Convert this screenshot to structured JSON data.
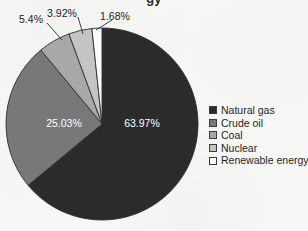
{
  "title": {
    "text": "gy",
    "note": "cropped-title-fragment"
  },
  "background_color": "#f7f7f5",
  "chart_data": {
    "type": "pie",
    "title": "",
    "categories": [
      "Natural gas",
      "Crude oil",
      "Coal",
      "Nuclear",
      "Renewable energy"
    ],
    "values": [
      63.97,
      25.03,
      5.4,
      3.92,
      1.68
    ],
    "value_labels": [
      "63.97%",
      "25.03%",
      "5.4%",
      "3.92%",
      "1.68%"
    ],
    "colors": [
      "#2b2b2b",
      "#787878",
      "#a8a8a8",
      "#c4c4c4",
      "#fbfbfa"
    ],
    "label_colors": [
      "#ffffff",
      "#ffffff",
      "#242424",
      "#242424",
      "#242424"
    ],
    "label_placement": [
      "inside",
      "inside",
      "outside",
      "outside",
      "outside"
    ],
    "start_angle_deg": 0,
    "direction": "clockwise",
    "legend_position": "right",
    "grid": false,
    "units": "percent"
  },
  "slices": [
    {
      "name": "Natural gas",
      "percent": 63.97,
      "label": "63.97%",
      "color": "#2b2b2b",
      "label_color": "#ffffff",
      "label_x": 142,
      "label_y": 124
    },
    {
      "name": "Crude oil",
      "percent": 25.03,
      "label": "25.03%",
      "color": "#787878",
      "label_color": "#ffffff",
      "label_x": 64,
      "label_y": 124
    },
    {
      "name": "Coal",
      "percent": 5.4,
      "label": "5.4%",
      "color": "#a8a8a8",
      "label_color": "#242424",
      "label_x": 31,
      "label_y": 20,
      "leader": {
        "x1": 47,
        "y1": 23,
        "x2": 62,
        "y2": 40
      }
    },
    {
      "name": "Nuclear",
      "percent": 3.92,
      "label": "3.92%",
      "color": "#c4c4c4",
      "label_color": "#242424",
      "label_x": 62,
      "label_y": 14,
      "leader": {
        "x1": 78,
        "y1": 17,
        "x2": 83,
        "y2": 34
      }
    },
    {
      "name": "Renewable energy",
      "percent": 1.68,
      "label": "1.68%",
      "color": "#fbfbfa",
      "label_color": "#242424",
      "label_x": 115,
      "label_y": 17,
      "leader": {
        "x1": 112,
        "y1": 20,
        "x2": 96,
        "y2": 30
      }
    }
  ],
  "legend": {
    "items": [
      {
        "label": "Natural gas",
        "color": "#2b2b2b"
      },
      {
        "label": "Crude oil",
        "color": "#787878"
      },
      {
        "label": "Coal",
        "color": "#a8a8a8"
      },
      {
        "label": "Nuclear",
        "color": "#c4c4c4"
      },
      {
        "label": "Renewable energy",
        "color": "#fbfbfa"
      }
    ]
  },
  "geometry": {
    "center_x": 102,
    "center_y": 124,
    "radius": 96
  }
}
